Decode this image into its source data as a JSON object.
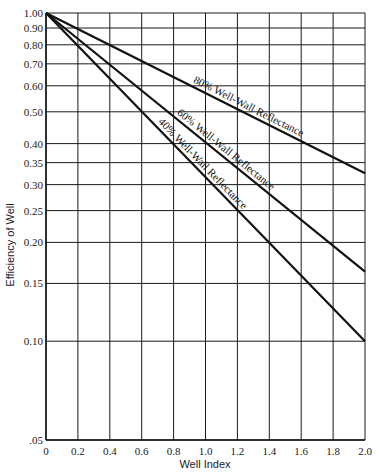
{
  "chart_data": {
    "type": "line",
    "title": "",
    "xlabel": "Well Index",
    "ylabel": "Efficiency of Well",
    "xlim": [
      0,
      2.0
    ],
    "ylim": [
      0.05,
      1.0
    ],
    "yscale": "log",
    "grid": true,
    "legend": "inline labels along lines",
    "x_ticks": [
      "0",
      "0.2",
      "0.4",
      "0.6",
      "0.8",
      "1.0",
      "1.2",
      "1.4",
      "1.6",
      "1.8",
      "2.0"
    ],
    "x_tick_values": [
      0,
      0.2,
      0.4,
      0.6,
      0.8,
      1.0,
      1.2,
      1.4,
      1.6,
      1.8,
      2.0
    ],
    "y_ticks": [
      "1.00",
      "0.90",
      "0.80",
      "0.70",
      "0.60",
      "0.50",
      "0.40",
      "0.35",
      "0.30",
      "0.25",
      "0.20",
      "0.15",
      "0.10",
      ".05"
    ],
    "y_tick_values": [
      1.0,
      0.9,
      0.8,
      0.7,
      0.6,
      0.5,
      0.4,
      0.35,
      0.3,
      0.25,
      0.2,
      0.15,
      0.1,
      0.05
    ],
    "series": [
      {
        "name": "80% Well-Wall Reflectance",
        "x": [
          0,
          2.0
        ],
        "y": [
          1.0,
          0.325
        ],
        "label_at": 1.25
      },
      {
        "name": "60% Well-Wall Reflectance",
        "x": [
          0,
          2.0
        ],
        "y": [
          1.0,
          0.163
        ],
        "label_at": 1.1
      },
      {
        "name": "40% Well-Wall Reflectance",
        "x": [
          0,
          2.0
        ],
        "y": [
          1.0,
          0.1
        ],
        "label_at": 0.95
      }
    ]
  }
}
